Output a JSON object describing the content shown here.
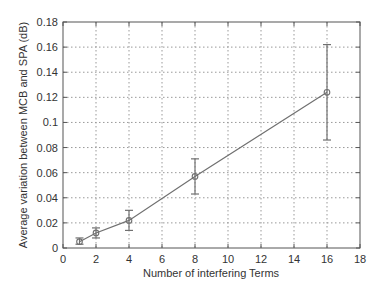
{
  "chart_data": {
    "type": "line",
    "title": "",
    "xlabel": "Number of interfering Terms",
    "ylabel": "Average variation between MCB and SPA (dB)",
    "xlim": [
      0,
      18
    ],
    "ylim": [
      0,
      0.18
    ],
    "xticks": [
      0,
      2,
      4,
      6,
      8,
      10,
      12,
      14,
      16,
      18
    ],
    "yticks": [
      0,
      0.02,
      0.04,
      0.06,
      0.08,
      0.1,
      0.12,
      0.14,
      0.16,
      0.18
    ],
    "xtick_labels": [
      "0",
      "2",
      "4",
      "6",
      "8",
      "10",
      "12",
      "14",
      "16",
      "18"
    ],
    "ytick_labels": [
      "0",
      "0.02",
      "0.04",
      "0.06",
      "0.08",
      "0.1",
      "0.12",
      "0.14",
      "0.16",
      "0.18"
    ],
    "grid": true,
    "legend": null,
    "series": [
      {
        "name": "MCB vs SPA",
        "x": [
          1,
          2,
          4,
          8,
          16
        ],
        "y": [
          0.005,
          0.012,
          0.022,
          0.057,
          0.124
        ],
        "err_low": [
          0.003,
          0.008,
          0.014,
          0.043,
          0.086
        ],
        "err_high": [
          0.008,
          0.016,
          0.03,
          0.071,
          0.162
        ],
        "color": "#707070",
        "marker": "circle"
      }
    ]
  }
}
